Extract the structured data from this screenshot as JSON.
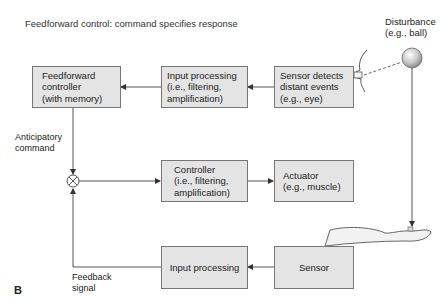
{
  "title": "Feedforward control: command specifies response",
  "panel_label": "B",
  "disturbance": {
    "label": "Disturbance\n(e.g., ball)"
  },
  "boxes": {
    "ff_controller": "Feedforward\ncontroller\n(with memory)",
    "ff_input_processing": "Input processing\n(i.e., filtering,\namplification)",
    "ff_sensor": "Sensor detects\ndistant events\n(e.g., eye)",
    "controller": "Controller\n(i.e., filtering,\namplification)",
    "actuator": "Actuator\n(e.g., muscle)",
    "fb_input_processing": "Input processing",
    "fb_sensor": "Sensor"
  },
  "labels": {
    "anticipatory": "Anticipatory\ncommand",
    "feedback": "Feedback\nsignal"
  },
  "colors": {
    "box_fill": "#e4e4e4",
    "box_border": "#777777",
    "line": "#555555"
  }
}
